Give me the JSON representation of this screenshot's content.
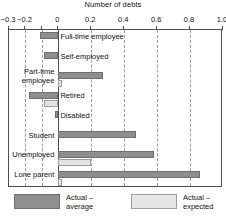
{
  "chart_data": {
    "type": "bar",
    "orientation": "horizontal",
    "title": "Number of debts",
    "xlabel": "Number of debts",
    "ylabel": "",
    "xlim": [
      -0.3,
      1.0
    ],
    "grid": true,
    "grid_axis": "x",
    "legend_position": "bottom",
    "tick_values": [
      -0.3,
      -0.2,
      -0.1,
      0,
      0.2,
      0.4,
      0.6,
      0.8,
      1.0
    ],
    "tick_labels": [
      "-0.3",
      "-0.2",
      "",
      "0",
      "0.2",
      "0.4",
      "0.6",
      "0.8",
      "1.0"
    ],
    "categories": [
      "Full-time employee",
      "Self-employed",
      "Part-time employee",
      "Retired",
      "Disabled",
      "Student",
      "Unemployed",
      "Lone parent"
    ],
    "series": [
      {
        "name": "Actual – average",
        "color": "#8e8e8e",
        "values": [
          -0.11,
          -0.09,
          0.27,
          -0.18,
          -0.02,
          0.47,
          0.58,
          0.86
        ]
      },
      {
        "name": "Actual – expected",
        "color": "#e2e2e2",
        "values": [
          0.0,
          0.0,
          0.02,
          -0.09,
          0.0,
          0.0,
          0.2,
          0.02
        ]
      }
    ]
  },
  "legend": {
    "items": [
      {
        "label_line1": "Actual –",
        "label_line2": "average",
        "swatch": "avg-swatch"
      },
      {
        "label_line1": "Actual –",
        "label_line2": "expected",
        "swatch": "exp-swatch"
      }
    ]
  }
}
